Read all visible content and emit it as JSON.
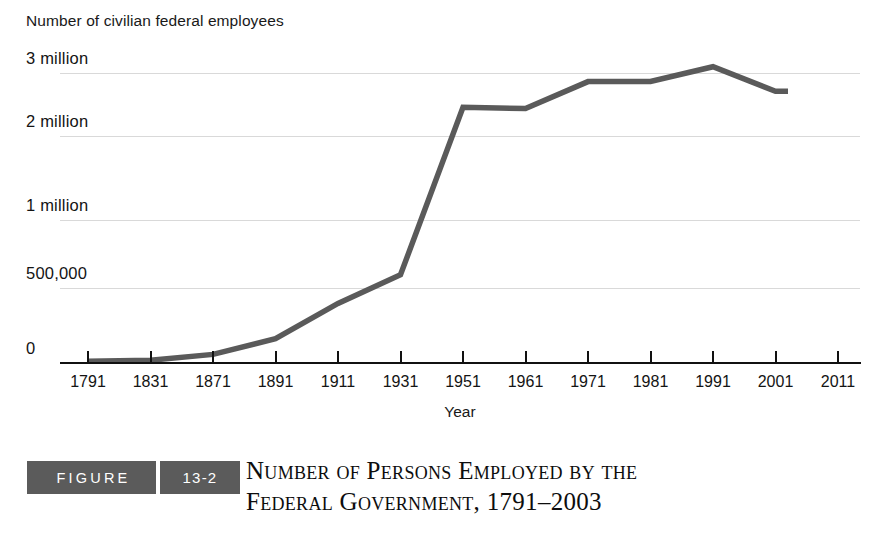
{
  "chart_data": {
    "type": "line",
    "ylabel": "Number of civilian federal employees",
    "xlabel": "Year",
    "categories": [
      "1791",
      "1831",
      "1871",
      "1891",
      "1911",
      "1931",
      "1951",
      "1961",
      "1971",
      "1981",
      "1991",
      "2001",
      "2003"
    ],
    "x_tick_labels": [
      "1791",
      "1831",
      "1871",
      "1891",
      "1911",
      "1931",
      "1951",
      "1961",
      "1971",
      "1981",
      "1991",
      "2001",
      "2011"
    ],
    "y_tick_labels": [
      "3 million",
      "2 million",
      "1 million",
      "500,000",
      "0"
    ],
    "y_tick_values": [
      3000000,
      2000000,
      1000000,
      500000,
      0
    ],
    "values": [
      4479,
      11491,
      51020,
      157442,
      395905,
      596745,
      2456000,
      2435804,
      2862926,
      2865000,
      3100000,
      2710000,
      2710000
    ],
    "series": [
      {
        "name": "Civilian federal employees",
        "values": [
          4479,
          11491,
          51020,
          157442,
          395905,
          596745,
          2456000,
          2435804,
          2862926,
          2865000,
          3100000,
          2710000,
          2710000
        ]
      }
    ],
    "ylim": [
      0,
      3000000
    ],
    "grid": true,
    "legend": "none",
    "line_color": "#5a5a5a"
  },
  "axes": {
    "y_title": "Number of civilian federal employees",
    "x_title": "Year",
    "y_labels": [
      {
        "text": "3 million",
        "y": 73
      },
      {
        "text": "2 million",
        "y": 136
      },
      {
        "text": "1 million",
        "y": 220
      },
      {
        "text": "500,000",
        "y": 288
      },
      {
        "text": "0",
        "y": 363
      }
    ],
    "x_labels": [
      "1791",
      "1831",
      "1871",
      "1891",
      "1911",
      "1931",
      "1951",
      "1961",
      "1971",
      "1981",
      "1991",
      "2001",
      "2011"
    ]
  },
  "caption": {
    "badge_word": "FIGURE",
    "badge_number": "13-2",
    "title_line1": "Number of Persons Employed by the",
    "title_line2": "Federal Government, 1791–2003"
  },
  "colors": {
    "line": "#5a5a5a",
    "grid": "#d9d9d9",
    "axis": "#111111",
    "badge_bg": "#5b5b5b",
    "text": "#141414"
  }
}
